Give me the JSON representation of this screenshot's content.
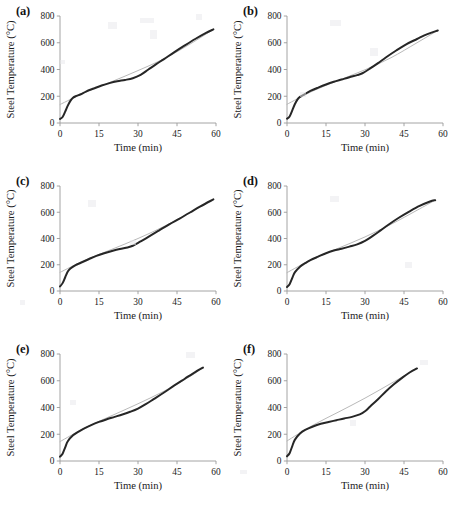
{
  "figure": {
    "panels": [
      "a",
      "b",
      "c",
      "d",
      "e",
      "f"
    ]
  },
  "axes": {
    "xlabel": "Time (min)",
    "ylabel": "Steel Temperature (°C)",
    "xticks": [
      "0",
      "15",
      "30",
      "45",
      "60"
    ],
    "yticks": [
      "0",
      "200",
      "400",
      "600",
      "800"
    ],
    "xlim": [
      0,
      60
    ],
    "ylim": [
      0,
      800
    ]
  },
  "labels": {
    "a": "(a)",
    "b": "(b)",
    "c": "(c)",
    "d": "(d)",
    "e": "(e)",
    "f": "(f)"
  },
  "colors": {
    "measured": "#262626",
    "model": "#b9b9b9",
    "axis": "#9a9a9a",
    "text": "#1a1a1a",
    "background": "#ffffff"
  },
  "chart_data": [
    {
      "id": "a",
      "type": "line",
      "title": "(a)",
      "xlabel": "Time (min)",
      "ylabel": "Steel Temperature (°C)",
      "xlim": [
        0,
        60
      ],
      "ylim": [
        0,
        800
      ],
      "xticks": [
        0,
        15,
        30,
        45,
        60
      ],
      "yticks": [
        0,
        200,
        400,
        600,
        800
      ],
      "grid": false,
      "legend": "none",
      "series": [
        {
          "name": "measured",
          "style": "thick-dark",
          "x": [
            0,
            1,
            2,
            3,
            4,
            5,
            6,
            8,
            10,
            13,
            16,
            19,
            22,
            25,
            28,
            31,
            34,
            37,
            40,
            44,
            48,
            52,
            56,
            59
          ],
          "y": [
            30,
            45,
            85,
            130,
            165,
            188,
            200,
            215,
            235,
            258,
            280,
            298,
            312,
            322,
            335,
            360,
            400,
            440,
            478,
            530,
            580,
            628,
            672,
            700
          ]
        },
        {
          "name": "model",
          "style": "thin-gray",
          "x": [
            0,
            10,
            20,
            30,
            40,
            50,
            59
          ],
          "y": [
            138,
            232,
            310,
            392,
            480,
            590,
            700
          ]
        }
      ]
    },
    {
      "id": "b",
      "type": "line",
      "title": "(b)",
      "xlabel": "Time (min)",
      "ylabel": "Steel Temperature (°C)",
      "xlim": [
        0,
        60
      ],
      "ylim": [
        0,
        800
      ],
      "xticks": [
        0,
        15,
        30,
        45,
        60
      ],
      "yticks": [
        0,
        200,
        400,
        600,
        800
      ],
      "grid": false,
      "legend": "none",
      "series": [
        {
          "name": "measured",
          "style": "thick-dark",
          "x": [
            0,
            1,
            2,
            3,
            4,
            5,
            7,
            9,
            12,
            15,
            18,
            21,
            24,
            27,
            29,
            32,
            35,
            38,
            42,
            46,
            50,
            54,
            58
          ],
          "y": [
            32,
            48,
            92,
            140,
            175,
            195,
            218,
            240,
            265,
            288,
            308,
            325,
            342,
            358,
            372,
            408,
            448,
            490,
            542,
            590,
            628,
            665,
            692
          ]
        },
        {
          "name": "model",
          "style": "thin-gray",
          "x": [
            0,
            10,
            20,
            30,
            40,
            50,
            58
          ],
          "y": [
            140,
            240,
            320,
            398,
            488,
            600,
            692
          ]
        }
      ]
    },
    {
      "id": "c",
      "type": "line",
      "title": "(c)",
      "xlabel": "Time (min)",
      "ylabel": "Steel Temperature (°C)",
      "xlim": [
        0,
        60
      ],
      "ylim": [
        0,
        800
      ],
      "xticks": [
        0,
        15,
        30,
        45,
        60
      ],
      "yticks": [
        0,
        200,
        400,
        600,
        800
      ],
      "grid": false,
      "legend": "none",
      "series": [
        {
          "name": "measured",
          "style": "thick-dark",
          "x": [
            0,
            1,
            2,
            3,
            4,
            6,
            8,
            11,
            14,
            17,
            20,
            23,
            26,
            28,
            31,
            34,
            38,
            42,
            46,
            50,
            54,
            59
          ],
          "y": [
            35,
            60,
            105,
            148,
            172,
            198,
            215,
            242,
            268,
            288,
            305,
            320,
            332,
            345,
            378,
            412,
            460,
            508,
            552,
            598,
            645,
            698
          ]
        },
        {
          "name": "model",
          "style": "thin-gray",
          "x": [
            0,
            10,
            20,
            30,
            40,
            50,
            59
          ],
          "y": [
            142,
            238,
            318,
            400,
            492,
            598,
            698
          ]
        }
      ]
    },
    {
      "id": "d",
      "type": "line",
      "title": "(d)",
      "xlabel": "Time (min)",
      "ylabel": "Steel Temperature (°C)",
      "xlim": [
        0,
        60
      ],
      "ylim": [
        0,
        800
      ],
      "xticks": [
        0,
        15,
        30,
        45,
        60
      ],
      "yticks": [
        0,
        200,
        400,
        600,
        800
      ],
      "grid": false,
      "legend": "none",
      "series": [
        {
          "name": "measured",
          "style": "thick-dark",
          "x": [
            0,
            1,
            2,
            3,
            5,
            7,
            9,
            12,
            15,
            18,
            21,
            24,
            27,
            30,
            33,
            36,
            39,
            43,
            47,
            51,
            55,
            57
          ],
          "y": [
            30,
            52,
            98,
            142,
            185,
            212,
            235,
            262,
            288,
            308,
            322,
            338,
            355,
            382,
            420,
            462,
            505,
            558,
            605,
            648,
            682,
            692
          ]
        },
        {
          "name": "model",
          "style": "thin-gray",
          "x": [
            0,
            10,
            20,
            30,
            40,
            50,
            57
          ],
          "y": [
            140,
            245,
            328,
            412,
            508,
            615,
            692
          ]
        }
      ]
    },
    {
      "id": "e",
      "type": "line",
      "title": "(e)",
      "xlabel": "Time (min)",
      "ylabel": "Steel Temperature (°C)",
      "xlim": [
        0,
        60
      ],
      "ylim": [
        0,
        800
      ],
      "xticks": [
        0,
        15,
        30,
        45,
        60
      ],
      "yticks": [
        0,
        200,
        400,
        600,
        800
      ],
      "grid": false,
      "legend": "none",
      "series": [
        {
          "name": "measured",
          "style": "thick-dark",
          "x": [
            0,
            1,
            2,
            3,
            5,
            7,
            9,
            12,
            15,
            18,
            21,
            24,
            27,
            30,
            33,
            36,
            40,
            44,
            48,
            52,
            55
          ],
          "y": [
            32,
            55,
            102,
            148,
            192,
            218,
            240,
            268,
            292,
            312,
            330,
            348,
            368,
            392,
            425,
            462,
            512,
            565,
            615,
            665,
            698
          ]
        },
        {
          "name": "model",
          "style": "thin-gray",
          "x": [
            0,
            10,
            20,
            30,
            40,
            50,
            55
          ],
          "y": [
            145,
            252,
            340,
            428,
            522,
            632,
            698
          ]
        }
      ]
    },
    {
      "id": "f",
      "type": "line",
      "title": "(f)",
      "xlabel": "Time (min)",
      "ylabel": "Steel Temperature (°C)",
      "xlim": [
        0,
        60
      ],
      "ylim": [
        0,
        800
      ],
      "xticks": [
        0,
        15,
        30,
        45,
        60
      ],
      "yticks": [
        0,
        200,
        400,
        600,
        800
      ],
      "grid": false,
      "legend": "none",
      "series": [
        {
          "name": "measured",
          "style": "thick-dark",
          "x": [
            0,
            1,
            2,
            3,
            5,
            7,
            10,
            13,
            16,
            19,
            22,
            25,
            28,
            30,
            32,
            35,
            38,
            41,
            44,
            47,
            50
          ],
          "y": [
            35,
            58,
            110,
            158,
            205,
            232,
            258,
            278,
            292,
            305,
            318,
            330,
            348,
            372,
            408,
            462,
            520,
            572,
            618,
            660,
            692
          ]
        },
        {
          "name": "model",
          "style": "thin-gray",
          "x": [
            0,
            10,
            20,
            30,
            40,
            50
          ],
          "y": [
            150,
            268,
            368,
            470,
            580,
            692
          ]
        }
      ]
    }
  ]
}
